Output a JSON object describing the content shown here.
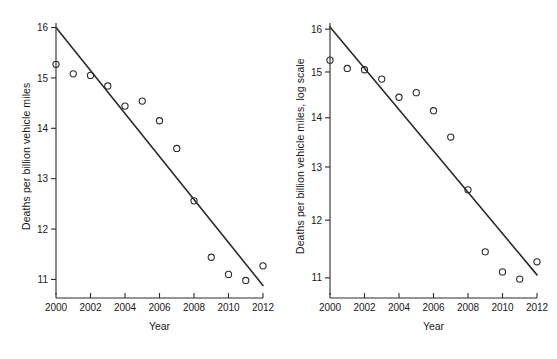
{
  "figure": {
    "width": 557,
    "height": 359,
    "background": "#ffffff",
    "ink_color": "#2b2b2b",
    "panel_count": 2
  },
  "chart_data": [
    {
      "panel": "left",
      "type": "scatter",
      "title": "",
      "xlabel": "Year",
      "ylabel": "Deaths per billion vehicle miles",
      "x": [
        2000,
        2001,
        2002,
        2003,
        2004,
        2005,
        2006,
        2007,
        2008,
        2009,
        2010,
        2011,
        2012
      ],
      "values": [
        15.27,
        15.08,
        15.05,
        14.84,
        14.44,
        14.54,
        14.15,
        13.6,
        12.56,
        11.44,
        11.1,
        10.98,
        11.27
      ],
      "xlim": [
        2000,
        2012
      ],
      "ylim": [
        10.85,
        16.05
      ],
      "xticks": [
        2000,
        2002,
        2004,
        2006,
        2008,
        2010,
        2012
      ],
      "xticklabels": [
        "2000",
        "2002",
        "2004",
        "2006",
        "2008",
        "2010",
        "2012"
      ],
      "yticks": [
        11,
        12,
        13,
        14,
        15,
        16
      ],
      "yticklabels": [
        "11",
        "12",
        "13",
        "14",
        "15",
        "16"
      ],
      "yscale": "linear",
      "grid": false,
      "legend": "none",
      "marker": "open-circle",
      "trendline": {
        "label": "linear fit",
        "x": [
          2000,
          2012
        ],
        "y": [
          16.0,
          10.88
        ]
      }
    },
    {
      "panel": "right",
      "type": "scatter",
      "title": "",
      "xlabel": "Year",
      "ylabel": "Deaths per billion vehicle miles, log scale",
      "x": [
        2000,
        2001,
        2002,
        2003,
        2004,
        2005,
        2006,
        2007,
        2008,
        2009,
        2010,
        2011,
        2012
      ],
      "values": [
        15.27,
        15.08,
        15.05,
        14.84,
        14.44,
        14.54,
        14.15,
        13.6,
        12.56,
        11.44,
        11.1,
        10.98,
        11.27
      ],
      "xlim": [
        2000,
        2012
      ],
      "ylim": [
        10.85,
        16.1
      ],
      "xticks": [
        2000,
        2002,
        2004,
        2006,
        2008,
        2010,
        2012
      ],
      "xticklabels": [
        "2000",
        "2002",
        "2004",
        "2006",
        "2008",
        "2010",
        "2012"
      ],
      "yticks": [
        11,
        12,
        13,
        14,
        15,
        16
      ],
      "yticklabels": [
        "11",
        "12",
        "13",
        "14",
        "15",
        "16"
      ],
      "yscale": "log",
      "grid": false,
      "legend": "none",
      "marker": "open-circle",
      "trendline": {
        "label": "log-linear fit",
        "x": [
          2000,
          2012
        ],
        "y": [
          16.05,
          11.05
        ]
      }
    }
  ]
}
